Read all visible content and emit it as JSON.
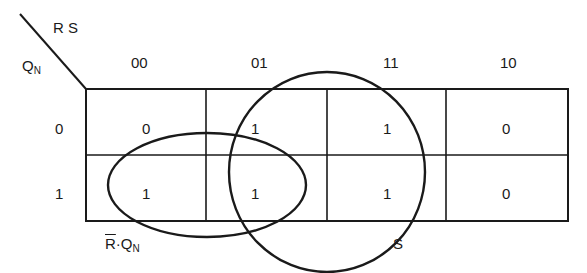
{
  "diagram": {
    "type": "karnaugh-map",
    "column_variables": "R S",
    "row_variable": {
      "base": "Q",
      "subscript": "N"
    },
    "column_headers": [
      "00",
      "01",
      "11",
      "10"
    ],
    "row_headers": [
      "0",
      "1"
    ],
    "cells": [
      [
        "0",
        "1",
        "1",
        "0"
      ],
      [
        "1",
        "1",
        "1",
        "0"
      ]
    ],
    "groups": [
      {
        "label": "S",
        "cells": [
          [
            0,
            1
          ],
          [
            0,
            2
          ],
          [
            1,
            1
          ],
          [
            1,
            2
          ]
        ]
      },
      {
        "label_overbar": "R",
        "label_rest": "·Q",
        "label_sub": "N",
        "cells": [
          [
            1,
            0
          ],
          [
            1,
            1
          ]
        ]
      }
    ],
    "group_s_label": "S",
    "group_rq_label": {
      "overbar": "R",
      "rest": "·Q",
      "sub": "N"
    },
    "line_color": "#1a1a1a"
  }
}
